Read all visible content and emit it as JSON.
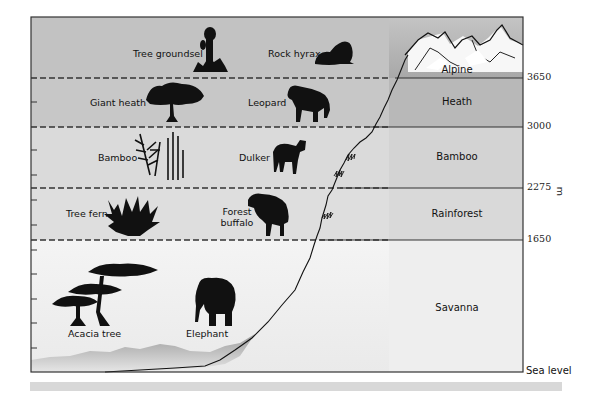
{
  "diagram": {
    "axis": {
      "unit_label": "m",
      "sea_level_label": "Sea level",
      "ticks": [
        "3650",
        "3000",
        "2275",
        "1650"
      ]
    },
    "zones": [
      {
        "name": "Alpine",
        "from_m": "3650",
        "to_m": "",
        "color": "#b9b9b9"
      },
      {
        "name": "Heath",
        "from_m": "3000",
        "to_m": "3650",
        "color": "#bdbdbd"
      },
      {
        "name": "Bamboo",
        "from_m": "2275",
        "to_m": "3000",
        "color": "#d6d6d6"
      },
      {
        "name": "Rainforest",
        "from_m": "1650",
        "to_m": "2275",
        "color": "#dcdcdc"
      },
      {
        "name": "Savanna",
        "from_m": "0",
        "to_m": "1650",
        "color": "#eeeeee"
      }
    ],
    "plants": [
      {
        "name": "Tree groundsel",
        "zone": "Alpine",
        "icon": "tree-groundsel-icon"
      },
      {
        "name": "Giant heath",
        "zone": "Heath",
        "icon": "giant-heath-icon"
      },
      {
        "name": "Bamboo",
        "zone": "Bamboo",
        "icon": "bamboo-icon"
      },
      {
        "name": "Tree fern",
        "zone": "Rainforest",
        "icon": "tree-fern-icon"
      },
      {
        "name": "Acacia tree",
        "zone": "Savanna",
        "icon": "acacia-tree-icon"
      }
    ],
    "animals": [
      {
        "name": "Rock hyrax",
        "zone": "Alpine",
        "icon": "rock-hyrax-icon"
      },
      {
        "name": "Leopard",
        "zone": "Heath",
        "icon": "leopard-icon"
      },
      {
        "name": "Dulker",
        "zone": "Bamboo",
        "icon": "duiker-icon"
      },
      {
        "name": "Forest",
        "name2": "buffalo",
        "zone": "Rainforest",
        "icon": "forest-buffalo-icon"
      },
      {
        "name": "Elephant",
        "zone": "Savanna",
        "icon": "elephant-icon"
      }
    ]
  }
}
